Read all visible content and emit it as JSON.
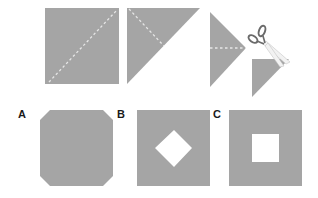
{
  "colors": {
    "paper": "#a5a5a5",
    "fold_line": "#e6e6e6",
    "background": "#ffffff",
    "label": "#1a1a1a",
    "scissors_handle": "#6a6a6a",
    "scissors_blade": "#f2f2f2"
  },
  "steps": [
    {
      "id": "step-1",
      "description": "square with diagonal fold line"
    },
    {
      "id": "step-2",
      "description": "folded triangle with second fold line"
    },
    {
      "id": "step-3",
      "description": "folded into smaller triangle with fold line"
    },
    {
      "id": "step-4",
      "description": "small triangle being cut by scissors"
    }
  ],
  "options": [
    {
      "label": "A",
      "shape": "octagon"
    },
    {
      "label": "B",
      "shape": "square-with-diamond-hole"
    },
    {
      "label": "C",
      "shape": "square-with-square-hole"
    }
  ]
}
